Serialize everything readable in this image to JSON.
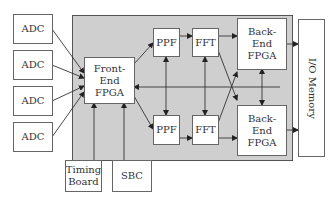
{
  "diagram": {
    "inputs": [
      {
        "label": "ADC"
      },
      {
        "label": "ADC"
      },
      {
        "label": "ADC"
      },
      {
        "label": "ADC"
      }
    ],
    "front_end": {
      "line1": "Front-End",
      "line2": "FPGA"
    },
    "top_path": {
      "ppf": "PPF",
      "fft": "FFT"
    },
    "bottom_path": {
      "ppf": "PPF",
      "fft": "FFT"
    },
    "back_end_top": {
      "line1": "Back-End",
      "line2": "FPGA"
    },
    "back_end_bottom": {
      "line1": "Back-End",
      "line2": "FPGA"
    },
    "io_memory": "I/O Memory",
    "timing_board": {
      "line1": "Timing",
      "line2": "Board"
    },
    "sbc": "SBC",
    "colors": {
      "panel": "#cfcfcf",
      "box": "#ffffff",
      "line": "#333333"
    }
  }
}
